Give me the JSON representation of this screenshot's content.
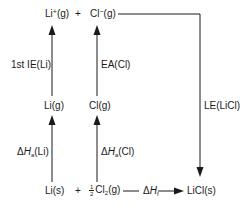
{
  "diagram": {
    "species": {
      "li_ion": "Li",
      "li_ion_charge": "+",
      "li_ion_state": "(g)",
      "plus_top": "+",
      "cl_ion": "Cl",
      "cl_ion_charge": "−",
      "cl_ion_state": "(g)",
      "li_gas": "Li(g)",
      "cl_gas": "Cl(g)",
      "li_solid": "Li(s)",
      "plus_bottom": "+",
      "half_num": "1",
      "half_den": "2",
      "cl2": "Cl",
      "cl2_sub": "2",
      "cl2_state": "(g)",
      "licl_solid": "LiCl(s)"
    },
    "steps": {
      "ie_label": "1st IE(Li)",
      "ea_label": "EA(Cl)",
      "le_label": "LE(LiCl)",
      "atom_li_delta": "Δ",
      "atom_li_H": "H",
      "atom_li_sub": "a",
      "atom_li_species": "(Li)",
      "atom_cl_delta": "Δ",
      "atom_cl_H": "H",
      "atom_cl_sub": "a",
      "atom_cl_species": "(Cl)",
      "formation_delta": "Δ",
      "formation_H": "H",
      "formation_sub": "f"
    },
    "colors": {
      "ink": "#1a1a1a",
      "background": "#ffffff"
    }
  }
}
